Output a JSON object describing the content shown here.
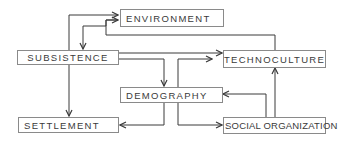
{
  "diagram": {
    "nodes": {
      "environment": "ENVIRONMENT",
      "subsistence": "SUBSISTENCE",
      "technoculture": "TECHNOCULTURE",
      "demography": "DEMOGRAPHY",
      "settlement": "SETTLEMENT",
      "social_organization": "SOCIAL ORGANIZATION"
    },
    "edges": [
      {
        "from": "SUBSISTENCE",
        "to": "ENVIRONMENT"
      },
      {
        "from": "ENVIRONMENT",
        "to": "SUBSISTENCE"
      },
      {
        "from": "TECHNOCULTURE",
        "to": "ENVIRONMENT"
      },
      {
        "from": "SUBSISTENCE",
        "to": "TECHNOCULTURE"
      },
      {
        "from": "SUBSISTENCE",
        "to": "DEMOGRAPHY"
      },
      {
        "from": "SUBSISTENCE",
        "to": "SETTLEMENT"
      },
      {
        "from": "DEMOGRAPHY",
        "to": "TECHNOCULTURE"
      },
      {
        "from": "DEMOGRAPHY",
        "to": "SETTLEMENT"
      },
      {
        "from": "DEMOGRAPHY",
        "to": "SOCIAL ORGANIZATION"
      },
      {
        "from": "SOCIAL ORGANIZATION",
        "to": "DEMOGRAPHY"
      },
      {
        "from": "SOCIAL ORGANIZATION",
        "to": "TECHNOCULTURE"
      }
    ],
    "colors": {
      "line": "#3a3a3a",
      "box_border": "#8a8a8a",
      "text": "#3a3a3a"
    }
  }
}
